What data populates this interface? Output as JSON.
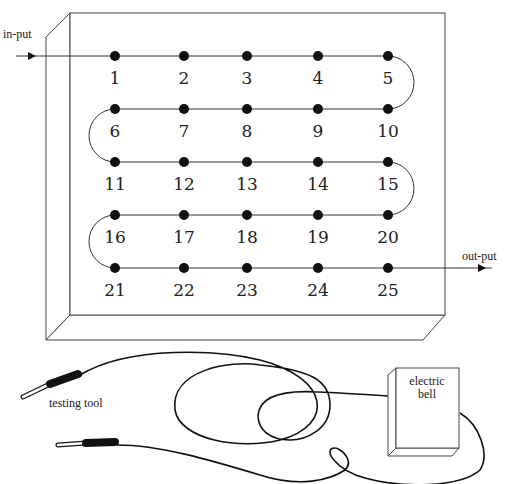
{
  "diagram": {
    "labels": {
      "input": "in-put",
      "output": "out-put",
      "testing_tool": "testing tool",
      "bell_line1": "electric",
      "bell_line2": "bell"
    },
    "points": [
      "1",
      "2",
      "3",
      "4",
      "5",
      "6",
      "7",
      "8",
      "9",
      "10",
      "11",
      "12",
      "13",
      "14",
      "15",
      "16",
      "17",
      "18",
      "19",
      "20",
      "21",
      "22",
      "23",
      "24",
      "25"
    ],
    "grid": {
      "rows": 5,
      "cols": 5
    },
    "wire_path": "serpentine 1→5, 5↷10, 10→6, 6↷11, 11→15, 15↷20, 20→16, 16↷21, 21→25"
  }
}
